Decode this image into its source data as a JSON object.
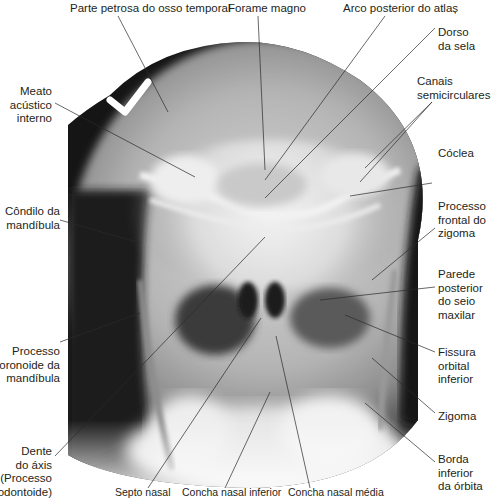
{
  "figure": {
    "type": "labeled-radiograph",
    "view": "skull-radiograph-posteroanterior",
    "colors": {
      "background": "#ffffff",
      "label_text": "#231f20",
      "leader_line": "#2a2a2a"
    }
  },
  "labels": {
    "top": [
      {
        "id": "parte-petrosa",
        "lines": [
          "Parte petrosa do osso temporal"
        ]
      },
      {
        "id": "forame-magno",
        "lines": [
          "Forame magno"
        ]
      },
      {
        "id": "arco-posterior-atlas",
        "lines": [
          "Arco posterior do atlaș"
        ]
      }
    ],
    "left": [
      {
        "id": "meato-acustico-interno",
        "lines": [
          "Meato",
          "acústico",
          "interno"
        ]
      },
      {
        "id": "condilo-mandibula",
        "lines": [
          "Côndilo da",
          "mandíbula"
        ]
      },
      {
        "id": "processo-coronoide",
        "lines": [
          "Processo",
          "coronoide da",
          "mandíbula"
        ]
      },
      {
        "id": "dente-axis",
        "lines": [
          "Dente",
          "do áxis",
          "(Processo",
          "odontoide)"
        ]
      }
    ],
    "right": [
      {
        "id": "dorso-sela",
        "lines": [
          "Dorso",
          "da sela"
        ]
      },
      {
        "id": "canais-semicirculares",
        "lines": [
          "Canais",
          "semicirculares"
        ]
      },
      {
        "id": "coclea",
        "lines": [
          "Cóclea"
        ]
      },
      {
        "id": "processo-frontal-zigoma",
        "lines": [
          "Processo",
          "frontal do",
          "zigoma"
        ]
      },
      {
        "id": "parede-posterior-seio",
        "lines": [
          "Parede",
          "posterior",
          "do seio",
          "maxilar"
        ]
      },
      {
        "id": "fissura-orbital-inferior",
        "lines": [
          "Fissura",
          "orbital",
          "inferior"
        ]
      },
      {
        "id": "zigoma",
        "lines": [
          "Zigoma"
        ]
      },
      {
        "id": "borda-inferior-orbita",
        "lines": [
          "Borda",
          "inferior",
          "da órbita"
        ]
      }
    ],
    "bottom": [
      {
        "id": "septo-nasal",
        "lines": [
          "Septo nasal"
        ]
      },
      {
        "id": "concha-nasal-inferior",
        "lines": [
          "Concha nasal inferior"
        ]
      },
      {
        "id": "concha-nasal-media",
        "lines": [
          "Concha nasal média"
        ]
      }
    ]
  }
}
